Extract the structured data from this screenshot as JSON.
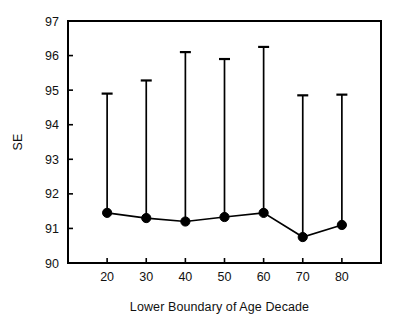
{
  "chart_data": {
    "type": "line",
    "title": "",
    "subtitle": "",
    "xlabel": "Lower Boundary of Age Decade",
    "ylabel": "SE",
    "x": [
      20,
      30,
      40,
      50,
      60,
      70,
      80
    ],
    "xtick_labels": [
      "20",
      "30",
      "40",
      "50",
      "60",
      "70",
      "80"
    ],
    "ytick_labels": [
      "90",
      "91",
      "92",
      "93",
      "94",
      "95",
      "96",
      "97"
    ],
    "ylim": [
      90,
      97
    ],
    "xlim": [
      10,
      90
    ],
    "grid": false,
    "legend": "none",
    "marker": "filled-circle",
    "error_bar_style": "upper-only-with-cap",
    "series": [
      {
        "name": "SE",
        "values": [
          91.45,
          91.3,
          91.2,
          91.33,
          91.45,
          90.75,
          91.1
        ],
        "error_upper": [
          94.9,
          95.28,
          96.1,
          95.9,
          96.25,
          94.85,
          94.87
        ]
      }
    ],
    "colors": {
      "line": "#000000",
      "marker": "#000000",
      "error_bar": "#000000",
      "axis": "#000000",
      "background": "#ffffff"
    }
  }
}
